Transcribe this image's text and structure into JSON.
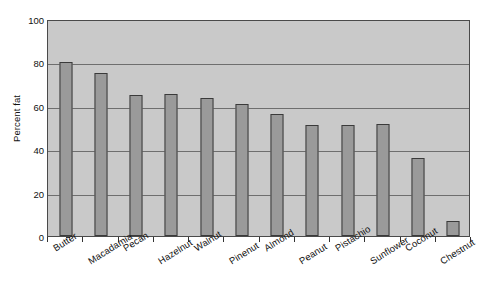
{
  "chart_data": {
    "type": "bar",
    "title": "",
    "xlabel": "",
    "ylabel": "Percent fat",
    "ylim": [
      0,
      100
    ],
    "yticks": [
      0,
      20,
      40,
      60,
      80,
      100
    ],
    "ytick_labels": [
      "0",
      "20",
      "40",
      "60",
      "80",
      "100"
    ],
    "grid": true,
    "legend": "none",
    "categories": [
      "Butter",
      "Macadamia",
      "Pecan",
      "Hazelnut",
      "Walnut",
      "Pinenut",
      "Almond",
      "Peanut",
      "Pistachio",
      "Sunflower",
      "Coconut",
      "Chestnut"
    ],
    "values": [
      80,
      75,
      65,
      65.5,
      63.5,
      61,
      56,
      51,
      51,
      51.5,
      36,
      7
    ],
    "colors": {
      "bar_fill": "#9a9a9a",
      "bar_border": "#3a3a3a",
      "plot_background": "#c9c9c9",
      "gridline": "#6e6e6e",
      "axis": "#4a4a4a",
      "text": "#111111",
      "page_background": "#ffffff"
    }
  }
}
